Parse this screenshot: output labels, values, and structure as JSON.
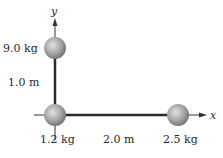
{
  "diagram": {
    "axes": {
      "x_label": "x",
      "y_label": "y",
      "origin_px": [
        55,
        115
      ],
      "axis_color": "#333333",
      "rod_color": "#2a2a2a"
    },
    "masses": [
      {
        "id": "top",
        "label": "9.0 kg",
        "position_m": [
          0,
          1.0
        ],
        "center_px": [
          55,
          48
        ],
        "radius_px": 11
      },
      {
        "id": "origin",
        "label": "1.2 kg",
        "position_m": [
          0,
          0
        ],
        "center_px": [
          55,
          115
        ],
        "radius_px": 11
      },
      {
        "id": "right",
        "label": "2.5 kg",
        "position_m": [
          2.0,
          0
        ],
        "center_px": [
          178,
          115
        ],
        "radius_px": 11
      }
    ],
    "distances": [
      {
        "id": "vertical",
        "label": "1.0 m"
      },
      {
        "id": "horizontal",
        "label": "2.0 m"
      }
    ],
    "ball_colors": {
      "highlight": "#e0e0e0",
      "mid": "#a9a9a9",
      "shadow": "#6f6f6f"
    }
  }
}
